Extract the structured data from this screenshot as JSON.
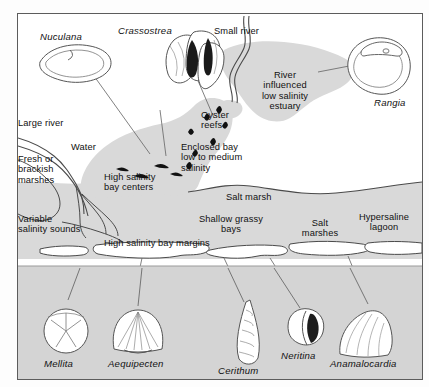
{
  "figure": {
    "kind": "coastal-salinity-zonation-diagram",
    "border_color": "#5c5c5c",
    "water_fill": "#d9d9d9",
    "land_fill": "#ffffff",
    "panel_fill": "#d4d4d4",
    "line_color": "#4a4a4a",
    "reef_color": "#111111"
  },
  "genera_top": [
    {
      "name": "Nuculana",
      "x": 22,
      "y": 18
    },
    {
      "name": "Crassostrea",
      "x": 118,
      "y": 13
    },
    {
      "name": "Rangia",
      "x": 375,
      "y": 85
    }
  ],
  "map_labels": [
    {
      "id": "small-river",
      "text": "Small river",
      "x": 213,
      "y": 14,
      "align": "left"
    },
    {
      "id": "river-estuary",
      "text": "River\ninfluenced\nlow salinity\nestuary",
      "x": 252,
      "y": 60,
      "align": "center"
    },
    {
      "id": "large-river",
      "text": "Large river",
      "x": 14,
      "y": 116,
      "align": "left"
    },
    {
      "id": "water",
      "text": "Water",
      "x": 66,
      "y": 140,
      "align": "left"
    },
    {
      "id": "fresh-brackish",
      "text": "Fresh or\nbrackish\nmarshes",
      "x": 6,
      "y": 152,
      "align": "left"
    },
    {
      "id": "oyster-reefs",
      "text": "Oyster\nreefs",
      "x": 197,
      "y": 107,
      "align": "left"
    },
    {
      "id": "enclosed-bay",
      "text": "Enclosed bay\nlow to medium\nsalinity",
      "x": 180,
      "y": 139,
      "align": "left"
    },
    {
      "id": "high-sal-centers",
      "text": "High salinity\nbay centers",
      "x": 102,
      "y": 170,
      "align": "left"
    },
    {
      "id": "variable-sounds",
      "text": "Variable\nsalinity sounds",
      "x": 4,
      "y": 212,
      "align": "left"
    },
    {
      "id": "salt-marsh",
      "text": "Salt marsh",
      "x": 228,
      "y": 190,
      "align": "left"
    },
    {
      "id": "shallow-grassy",
      "text": "Shallow grassy\nbays",
      "x": 197,
      "y": 212,
      "align": "center"
    },
    {
      "id": "salt-marshes",
      "text": "Salt\nmarshes",
      "x": 304,
      "y": 216,
      "align": "center"
    },
    {
      "id": "hypersaline",
      "text": "Hypersaline\nlagoon",
      "x": 365,
      "y": 210,
      "align": "center"
    },
    {
      "id": "high-sal-margins",
      "text": "High salinity bay margins",
      "x": 104,
      "y": 236,
      "align": "left"
    }
  ],
  "genera_bottom": [
    {
      "name": "Mellita",
      "x": 41,
      "y": 357
    },
    {
      "name": "Aequipecten",
      "x": 110,
      "y": 357
    },
    {
      "name": "Cerithum",
      "x": 221,
      "y": 364
    },
    {
      "name": "Neritina",
      "x": 280,
      "y": 349
    },
    {
      "name": "Anamalocardia",
      "x": 330,
      "y": 357
    }
  ]
}
